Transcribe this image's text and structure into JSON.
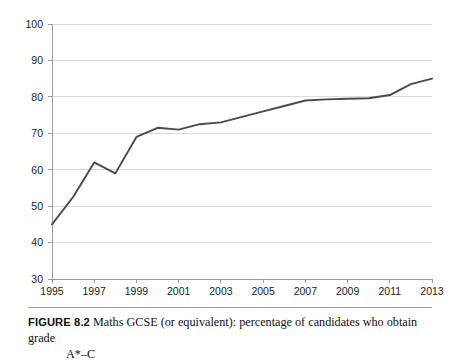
{
  "figure": {
    "label": "FIGURE 8.2",
    "caption_line_1": "Maths GCSE (or equivalent): percentage of candidates who obtain grade",
    "caption_line_2": "A*–C"
  },
  "colors": {
    "line": "#4a4a4a",
    "gridline": "#d6d6d6",
    "axis": "#9a9a9a",
    "text": "#1c1c1c",
    "background": "#ffffff"
  },
  "chart_data": {
    "type": "line",
    "title": "Maths GCSE (or equivalent): percentage of candidates who obtain grade A*–C",
    "xlabel": "",
    "ylabel": "",
    "xlim": [
      1995,
      2013
    ],
    "ylim": [
      30,
      100
    ],
    "grid": true,
    "legend": false,
    "y_ticks": [
      30,
      40,
      50,
      60,
      70,
      80,
      90,
      100
    ],
    "y_tick_labels": [
      "30",
      "40",
      "50",
      "60",
      "70",
      "80",
      "90",
      "100"
    ],
    "x_ticks": [
      1995,
      1997,
      1999,
      2001,
      2003,
      2005,
      2007,
      2009,
      2011,
      2013
    ],
    "x_tick_labels": [
      "1995",
      "1997",
      "1999",
      "2001",
      "2003",
      "2005",
      "2007",
      "2009",
      "2011",
      "2013"
    ],
    "x": [
      1995,
      1996,
      1997,
      1998,
      1999,
      2000,
      2001,
      2002,
      2003,
      2004,
      2005,
      2006,
      2007,
      2008,
      2009,
      2010,
      2011,
      2012,
      2013
    ],
    "series": [
      {
        "name": "Percentage achieving A*–C",
        "values": [
          45,
          52.5,
          62,
          59,
          69,
          71.5,
          71,
          72.5,
          73,
          74.5,
          76,
          77.5,
          79,
          79.3,
          79.5,
          79.6,
          80.5,
          83.5,
          85
        ]
      }
    ]
  }
}
